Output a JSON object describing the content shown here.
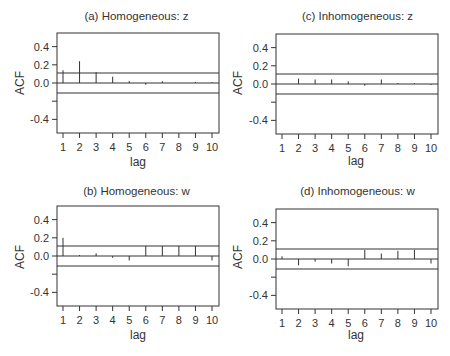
{
  "figure": {
    "background": "#ffffff",
    "line_color": "#333333"
  },
  "panels": [
    {
      "id": "a",
      "title": "(a) Homogeneous: z",
      "ylabel": "ACF",
      "xlabel": "lag"
    },
    {
      "id": "c",
      "title": "(c) Inhomogeneous: z",
      "ylabel": "ACF",
      "xlabel": "lag"
    },
    {
      "id": "b",
      "title": "(b) Homogeneous: w",
      "ylabel": "ACF",
      "xlabel": "lag"
    },
    {
      "id": "d",
      "title": "(d) Inhomogeneous: w",
      "ylabel": "ACF",
      "xlabel": "lag"
    }
  ],
  "chart_data": [
    {
      "type": "bar",
      "subtype": "acf-stem",
      "title": "(a) Homogeneous: z",
      "xlabel": "lag",
      "ylabel": "ACF",
      "categories": [
        1,
        2,
        3,
        4,
        5,
        6,
        7,
        8,
        9,
        10
      ],
      "values": [
        0.14,
        0.24,
        0.12,
        0.07,
        0.02,
        -0.02,
        0.02,
        0.0,
        0.01,
        0.01
      ],
      "confidence_band": [
        -0.11,
        0.11
      ],
      "ylim": [
        -0.55,
        0.55
      ],
      "yticks": [
        0.4,
        0.2,
        0.0,
        -0.2,
        -0.4
      ],
      "ytick_labels": [
        "0.4",
        "0.2",
        "0.0",
        "",
        "-0.4"
      ],
      "xticks": [
        1,
        2,
        3,
        4,
        5,
        6,
        7,
        8,
        9,
        10
      ],
      "grid": false
    },
    {
      "type": "bar",
      "subtype": "acf-stem",
      "title": "(c) Inhomogeneous: z",
      "xlabel": "lag",
      "ylabel": "ACF",
      "categories": [
        1,
        2,
        3,
        4,
        5,
        6,
        7,
        8,
        9,
        10
      ],
      "values": [
        0.0,
        0.06,
        0.05,
        0.05,
        0.03,
        -0.02,
        0.05,
        0.01,
        0.01,
        -0.01
      ],
      "confidence_band": [
        -0.11,
        0.11
      ],
      "ylim": [
        -0.55,
        0.55
      ],
      "yticks": [
        0.4,
        0.2,
        0.0,
        -0.2,
        -0.4
      ],
      "ytick_labels": [
        "0.4",
        "0.2",
        "0.0",
        "",
        "-0.4"
      ],
      "xticks": [
        1,
        2,
        3,
        4,
        5,
        6,
        7,
        8,
        9,
        10
      ],
      "grid": false
    },
    {
      "type": "bar",
      "subtype": "acf-stem",
      "title": "(b) Homogeneous: w",
      "xlabel": "lag",
      "ylabel": "ACF",
      "categories": [
        1,
        2,
        3,
        4,
        5,
        6,
        7,
        8,
        9,
        10
      ],
      "values": [
        0.2,
        0.01,
        0.03,
        -0.02,
        -0.05,
        0.11,
        0.11,
        0.11,
        0.11,
        -0.05
      ],
      "confidence_band": [
        -0.11,
        0.11
      ],
      "ylim": [
        -0.55,
        0.55
      ],
      "yticks": [
        0.4,
        0.2,
        0.0,
        -0.2,
        -0.4
      ],
      "ytick_labels": [
        "0.4",
        "0.2",
        "0.0",
        "",
        "-0.4"
      ],
      "xticks": [
        1,
        2,
        3,
        4,
        5,
        6,
        7,
        8,
        9,
        10
      ],
      "grid": false
    },
    {
      "type": "bar",
      "subtype": "acf-stem",
      "title": "(d) Inhomogeneous: w",
      "xlabel": "lag",
      "ylabel": "ACF",
      "categories": [
        1,
        2,
        3,
        4,
        5,
        6,
        7,
        8,
        9,
        10
      ],
      "values": [
        0.03,
        -0.07,
        -0.03,
        -0.05,
        -0.08,
        0.1,
        0.06,
        0.09,
        0.1,
        -0.05
      ],
      "confidence_band": [
        -0.11,
        0.11
      ],
      "ylim": [
        -0.55,
        0.55
      ],
      "yticks": [
        0.4,
        0.2,
        0.0,
        -0.2,
        -0.4
      ],
      "ytick_labels": [
        "0.4",
        "0.2",
        "0.0",
        "",
        "-0.4"
      ],
      "xticks": [
        1,
        2,
        3,
        4,
        5,
        6,
        7,
        8,
        9,
        10
      ],
      "grid": false
    }
  ]
}
